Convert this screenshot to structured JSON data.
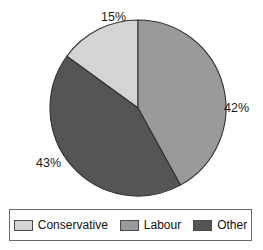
{
  "chart_data": {
    "type": "pie",
    "title": "",
    "categories": [
      "Conservative",
      "Labour",
      "Other"
    ],
    "values": [
      15,
      42,
      43
    ],
    "value_labels": [
      "15%",
      "42%",
      "43%"
    ],
    "unit": "percent",
    "start_angle_deg": 0,
    "direction": "clockwise",
    "colors": [
      "#d4d4d4",
      "#9a9a9a",
      "#555555"
    ],
    "legend_position": "bottom",
    "grid": false,
    "slices": [
      {
        "label": "Conservative",
        "value": 15,
        "value_label": "15%",
        "color": "#d4d4d4",
        "start_deg": 306.0,
        "end_deg": 360.0
      },
      {
        "label": "Labour",
        "value": 42,
        "value_label": "42%",
        "color": "#9a9a9a",
        "start_deg": 0.0,
        "end_deg": 151.2
      },
      {
        "label": "Other",
        "value": 43,
        "value_label": "43%",
        "color": "#555555",
        "start_deg": 151.2,
        "end_deg": 306.0
      }
    ]
  },
  "legend": {
    "items": [
      {
        "label": "Conservative",
        "color": "#d4d4d4"
      },
      {
        "label": "Labour",
        "color": "#9a9a9a"
      },
      {
        "label": "Other",
        "color": "#555555"
      }
    ]
  },
  "geometry": {
    "center_x": 138,
    "center_y": 108,
    "radius": 88
  }
}
